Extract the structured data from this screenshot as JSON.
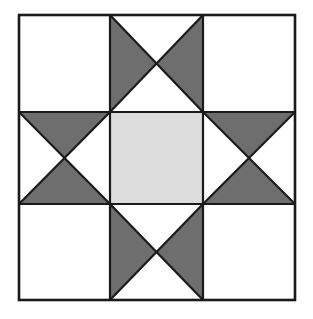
{
  "figure": {
    "canvas_width": 313,
    "canvas_height": 319,
    "background_color": "#FFFFFF"
  },
  "colors": {
    "background": "#FFFFFF",
    "patch_light": "#FFFFFF",
    "patch_medium": "#DCDCDC",
    "patch_dark": "#6E6E6E",
    "outline": "#1A1A1A"
  },
  "block": {
    "name": "Ohio Star",
    "x": 19,
    "y": 15,
    "width": 276,
    "height": 285,
    "rows": 3,
    "columns": 3,
    "outer_stroke_width": 2.6,
    "inner_stroke_width": 2.2,
    "grid_x": [
      19,
      110,
      203,
      295
    ],
    "grid_y": [
      15,
      112,
      204,
      300
    ]
  },
  "cells": [
    {
      "id": "cell-top-left",
      "row": 0,
      "col": 0,
      "unit": "plain-square",
      "fill": "#FFFFFF"
    },
    {
      "id": "cell-top-center",
      "row": 0,
      "col": 1,
      "unit": "quarter-square-triangle",
      "orientation": "horizontal-bowtie",
      "triangles": {
        "top": "#FFFFFF",
        "right": "#6E6E6E",
        "bottom": "#FFFFFF",
        "left": "#6E6E6E"
      }
    },
    {
      "id": "cell-top-right",
      "row": 0,
      "col": 2,
      "unit": "plain-square",
      "fill": "#FFFFFF"
    },
    {
      "id": "cell-middle-left",
      "row": 1,
      "col": 0,
      "unit": "quarter-square-triangle",
      "orientation": "vertical-bowtie",
      "triangles": {
        "top": "#6E6E6E",
        "right": "#FFFFFF",
        "bottom": "#6E6E6E",
        "left": "#FFFFFF"
      }
    },
    {
      "id": "cell-middle-center",
      "row": 1,
      "col": 1,
      "unit": "plain-square",
      "fill": "#DCDCDC"
    },
    {
      "id": "cell-middle-right",
      "row": 1,
      "col": 2,
      "unit": "quarter-square-triangle",
      "orientation": "vertical-bowtie",
      "triangles": {
        "top": "#6E6E6E",
        "right": "#FFFFFF",
        "bottom": "#6E6E6E",
        "left": "#FFFFFF"
      }
    },
    {
      "id": "cell-bottom-left",
      "row": 2,
      "col": 0,
      "unit": "plain-square",
      "fill": "#FFFFFF"
    },
    {
      "id": "cell-bottom-center",
      "row": 2,
      "col": 1,
      "unit": "quarter-square-triangle",
      "orientation": "horizontal-bowtie",
      "triangles": {
        "top": "#FFFFFF",
        "right": "#6E6E6E",
        "bottom": "#FFFFFF",
        "left": "#6E6E6E"
      }
    },
    {
      "id": "cell-bottom-right",
      "row": 2,
      "col": 2,
      "unit": "plain-square",
      "fill": "#FFFFFF"
    }
  ]
}
